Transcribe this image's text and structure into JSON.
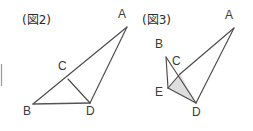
{
  "canvas": {
    "width": 253,
    "height": 131,
    "background": "#ffffff"
  },
  "style": {
    "line_color": "#4a4a4a",
    "base_line_color": "#555555",
    "shade_color": "#d8d8d8",
    "label_color": "#3a3a3a",
    "caption_color": "#2b2b2b"
  },
  "figures": [
    {
      "id": "figure-2",
      "caption": "(図2)",
      "caption_pos": {
        "x": 22,
        "y": 10
      },
      "description": "triangle-abd-with-point-c",
      "points": {
        "A": {
          "x": 127,
          "y": 27,
          "label": "A",
          "label_x": 118,
          "label_y": 8
        },
        "B": {
          "x": 33,
          "y": 104,
          "label": "B",
          "label_x": 23,
          "label_y": 105
        },
        "C": {
          "x": 68,
          "y": 79,
          "label": "C",
          "label_x": 58,
          "label_y": 60
        },
        "D": {
          "x": 90,
          "y": 103,
          "label": "D",
          "label_x": 86,
          "label_y": 105
        }
      },
      "edges": [
        {
          "from": "B",
          "to": "A",
          "name": "edge-ba"
        },
        {
          "from": "A",
          "to": "D",
          "name": "edge-ad"
        },
        {
          "from": "B",
          "to": "D",
          "name": "edge-bd"
        },
        {
          "from": "C",
          "to": "D",
          "name": "edge-cd"
        }
      ]
    },
    {
      "id": "figure-3",
      "caption": "(図3)",
      "caption_pos": {
        "x": 142,
        "y": 10
      },
      "description": "folded-figure-with-shaded-triangle-ecd",
      "points": {
        "A": {
          "x": 234,
          "y": 28,
          "label": "A",
          "label_x": 225,
          "label_y": 9
        },
        "B": {
          "x": 166,
          "y": 57,
          "label": "B",
          "label_x": 155,
          "label_y": 38
        },
        "C": {
          "x": 180,
          "y": 74,
          "label": "C",
          "label_x": 172,
          "label_y": 55
        },
        "D": {
          "x": 196,
          "y": 103,
          "label": "D",
          "label_x": 192,
          "label_y": 106
        },
        "E": {
          "x": 168,
          "y": 88,
          "label": "E",
          "label_x": 155,
          "label_y": 86
        }
      },
      "edges": [
        {
          "from": "B",
          "to": "E",
          "name": "edge-be"
        },
        {
          "from": "B",
          "to": "D",
          "name": "edge-bd"
        },
        {
          "from": "E",
          "to": "C",
          "name": "edge-ec"
        },
        {
          "from": "E",
          "to": "D",
          "name": "edge-ed"
        },
        {
          "from": "C",
          "to": "A",
          "name": "edge-ca"
        },
        {
          "from": "A",
          "to": "D",
          "name": "edge-ad"
        },
        {
          "from": "C",
          "to": "D",
          "name": "edge-cd"
        }
      ],
      "shaded_region": {
        "name": "shaded-triangle-ecd",
        "vertices": [
          "E",
          "C",
          "D"
        ],
        "color": "#d8d8d8"
      }
    }
  ],
  "artifacts": {
    "left_edge_mark": {
      "x": 0,
      "y": 64,
      "width": 3,
      "height": 22,
      "name": "cropped-edge-mark"
    }
  }
}
